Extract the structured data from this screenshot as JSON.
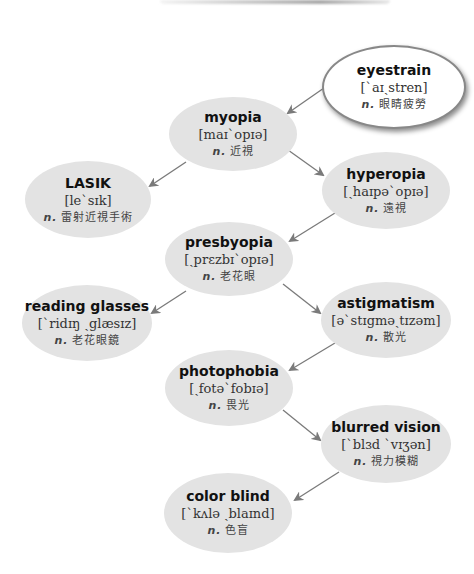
{
  "diagram": {
    "colors": {
      "node_fill": "#e3e3e3",
      "root_fill": "#ffffff",
      "arrow": "#7a7a7a",
      "text": "#111111"
    },
    "nodes": [
      {
        "id": "eyestrain",
        "term": "eyestrain",
        "ipa": "[ˋaɪˏstren]",
        "pos": "n.",
        "definition": "眼睛疲勞"
      },
      {
        "id": "myopia",
        "term": "myopia",
        "ipa": "[maɪˋopɪə]",
        "pos": "n.",
        "definition": "近視"
      },
      {
        "id": "lasik",
        "term": "LASIK",
        "ipa": "[leˋsɪk]",
        "pos": "n.",
        "definition": "雷射近視手術"
      },
      {
        "id": "hyperopia",
        "term": "hyperopia",
        "ipa": "[ˏhaɪpəˋopɪə]",
        "pos": "n.",
        "definition": "遠視"
      },
      {
        "id": "presbyopia",
        "term": "presbyopia",
        "ipa": "[ˏprɛzbɪˋopɪə]",
        "pos": "n.",
        "definition": "老花眼"
      },
      {
        "id": "reading_glasses",
        "term": "reading glasses",
        "ipa": "[ˋridɪŋ ˏglæsɪz]",
        "pos": "n.",
        "definition": "老花眼鏡"
      },
      {
        "id": "astigmatism",
        "term": "astigmatism",
        "ipa": "[əˋstɪgməˏtɪzəm]",
        "pos": "n.",
        "definition": "散光"
      },
      {
        "id": "photophobia",
        "term": "photophobia",
        "ipa": "[ˏfotəˋfobɪə]",
        "pos": "n.",
        "definition": "畏光"
      },
      {
        "id": "blurred_vision",
        "term": "blurred vision",
        "ipa": "[ˋblɜd ˋvɪʒən]",
        "pos": "n.",
        "definition": "視力模糊"
      },
      {
        "id": "color_blind",
        "term": "color blind",
        "ipa": "[ˋkʌlə ˏblaɪnd]",
        "pos": "n.",
        "definition": "色盲"
      }
    ],
    "edges": [
      {
        "from": "eyestrain",
        "to": "myopia"
      },
      {
        "from": "myopia",
        "to": "lasik"
      },
      {
        "from": "myopia",
        "to": "hyperopia"
      },
      {
        "from": "hyperopia",
        "to": "presbyopia"
      },
      {
        "from": "presbyopia",
        "to": "reading_glasses"
      },
      {
        "from": "presbyopia",
        "to": "astigmatism"
      },
      {
        "from": "astigmatism",
        "to": "photophobia"
      },
      {
        "from": "photophobia",
        "to": "blurred_vision"
      },
      {
        "from": "blurred_vision",
        "to": "color_blind"
      }
    ]
  }
}
